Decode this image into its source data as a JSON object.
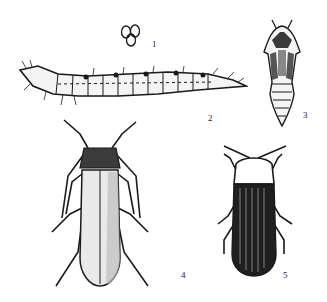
{
  "figure": {
    "type": "entomological-illustration",
    "panels": [
      {
        "id": "eggs",
        "label": "1",
        "subject": "eggs"
      },
      {
        "id": "larva",
        "label": "2",
        "subject": "larva"
      },
      {
        "id": "pupa",
        "label": "3",
        "subject": "pupa"
      },
      {
        "id": "adult-a",
        "label": "4",
        "subject": "adult beetle (elongate, pale elytra)"
      },
      {
        "id": "adult-b",
        "label": "5",
        "subject": "adult beetle (dark elytra, pale pronotum)"
      }
    ],
    "colors": {
      "ink": "#1a1a1a",
      "paper": "#ffffff"
    }
  }
}
